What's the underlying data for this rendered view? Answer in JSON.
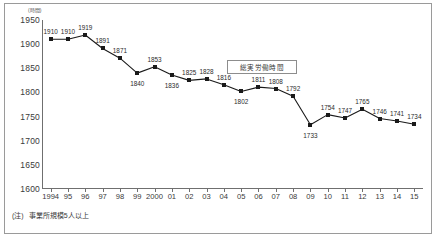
{
  "chart_data": {
    "type": "line",
    "title": "",
    "xlabel": "",
    "ylabel": "",
    "y_unit": "(時間)",
    "ylim": [
      1600,
      1950
    ],
    "yticks": [
      "1600",
      "1650",
      "1700",
      "1750",
      "1800",
      "1850",
      "1900",
      "1950"
    ],
    "grid": false,
    "legend_position": "inside-center",
    "categories": [
      "1994",
      "95",
      "96",
      "97",
      "98",
      "99",
      "2000",
      "01",
      "02",
      "03",
      "04",
      "05",
      "06",
      "07",
      "08",
      "09",
      "10",
      "11",
      "12",
      "13",
      "14",
      "15"
    ],
    "series": [
      {
        "name": "総実労働時間",
        "values": [
          1910,
          1910,
          1919,
          1891,
          1871,
          1840,
          1853,
          1836,
          1825,
          1828,
          1816,
          1802,
          1811,
          1808,
          1792,
          1733,
          1754,
          1747,
          1765,
          1746,
          1741,
          1734
        ],
        "marker": "square",
        "color": "#1a1a1a"
      }
    ],
    "annotations": [
      "(注)　事業所規模5人以上"
    ]
  },
  "legend": {
    "label": "総実労働時間"
  },
  "footnote": {
    "mark": "(注)",
    "text": "事業所規模5人以上"
  }
}
